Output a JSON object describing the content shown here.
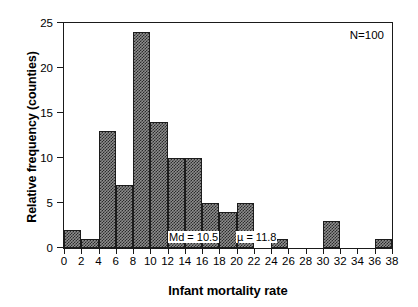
{
  "chart_data": {
    "type": "bar",
    "title": "",
    "xlabel": "Infant mortality rate",
    "ylabel": "Relative frequency (counties)",
    "xlim": [
      0,
      38
    ],
    "ylim": [
      0,
      25
    ],
    "grid": false,
    "legend": null,
    "xticks": [
      0,
      2,
      4,
      6,
      8,
      10,
      12,
      14,
      16,
      18,
      20,
      22,
      24,
      26,
      28,
      30,
      32,
      34,
      36,
      38
    ],
    "yticks": [
      0,
      5,
      10,
      15,
      20,
      25
    ],
    "bin_width": 2,
    "categories": [
      "0-2",
      "2-4",
      "4-6",
      "6-8",
      "8-10",
      "10-12",
      "12-14",
      "14-16",
      "16-18",
      "18-20",
      "20-22",
      "22-24",
      "24-26",
      "26-28",
      "28-30",
      "30-32",
      "32-34",
      "34-36",
      "36-38"
    ],
    "bin_starts": [
      0,
      2,
      4,
      6,
      8,
      10,
      12,
      14,
      16,
      18,
      20,
      22,
      24,
      26,
      28,
      30,
      32,
      34,
      36
    ],
    "values": [
      2,
      1,
      13,
      7,
      24,
      14,
      10,
      10,
      5,
      4,
      5,
      0,
      1,
      0,
      0,
      3,
      0,
      0,
      1
    ],
    "annotations": [
      {
        "name": "sample-size",
        "text": "N=100",
        "value": 100
      },
      {
        "name": "median",
        "text": "Md = 10.5",
        "value": 10.5
      },
      {
        "name": "mean",
        "text": "µ = 11.8",
        "value": 11.8
      }
    ],
    "colors": {
      "bar_fill": "#8d8d8d",
      "bar_pattern": "#2b2b2b",
      "bar_edge": "#1c1c1c",
      "axis": "#1a1a1a",
      "background": "#ffffff",
      "text": "#000000"
    }
  }
}
